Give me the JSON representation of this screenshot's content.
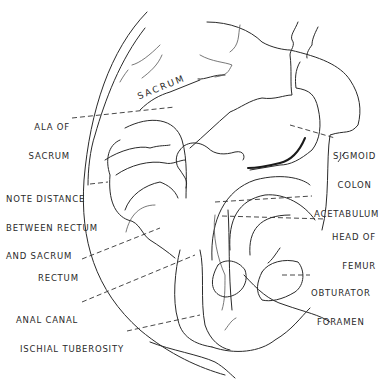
{
  "diagram": {
    "colors": {
      "line": "#2a2a2a",
      "background": "#ffffff"
    },
    "structure_label": "SACRUM",
    "labels": [
      {
        "id": "ala_of_sacrum",
        "line1": "ALA OF",
        "line2": "SACRUM"
      },
      {
        "id": "note_distance",
        "line1": "NOTE DISTANCE",
        "line2": "BETWEEN RECTUM",
        "line3": "AND SACRUM"
      },
      {
        "id": "rectum",
        "line1": "RECTUM"
      },
      {
        "id": "anal_canal",
        "line1": "ANAL CANAL"
      },
      {
        "id": "ischial_tuberosity",
        "line1": "ISCHIAL TUBEROSITY"
      },
      {
        "id": "sigmoid_colon",
        "line1": "SIGMOID",
        "line2": "COLON"
      },
      {
        "id": "acetabulum",
        "line1": "ACETABULUM"
      },
      {
        "id": "head_of_femur",
        "line1": "HEAD OF",
        "line2": "FEMUR"
      },
      {
        "id": "obturator_foramen",
        "line1": "OBTURATOR",
        "line2": "FORAMEN"
      }
    ]
  }
}
